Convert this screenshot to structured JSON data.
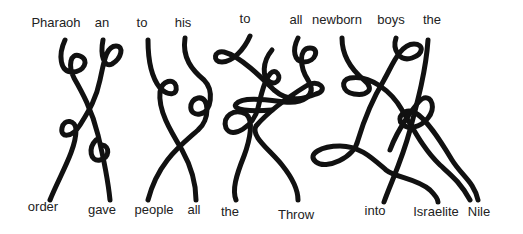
{
  "diagram": {
    "type": "tangled-lines-word-puzzle",
    "top_words": [
      {
        "label": "Pharaoh",
        "x": 56,
        "y": 16
      },
      {
        "label": "an",
        "x": 102,
        "y": 16
      },
      {
        "label": "to",
        "x": 142,
        "y": 16
      },
      {
        "label": "his",
        "x": 183,
        "y": 16
      },
      {
        "label": "to",
        "x": 245,
        "y": 12
      },
      {
        "label": "all",
        "x": 296,
        "y": 13
      },
      {
        "label": "newborn",
        "x": 337,
        "y": 13
      },
      {
        "label": "boys",
        "x": 391,
        "y": 13
      },
      {
        "label": "the",
        "x": 432,
        "y": 13
      }
    ],
    "bottom_words": [
      {
        "label": "order",
        "x": 43,
        "y": 200
      },
      {
        "label": "gave",
        "x": 102,
        "y": 203
      },
      {
        "label": "people",
        "x": 154,
        "y": 203
      },
      {
        "label": "all",
        "x": 194,
        "y": 203
      },
      {
        "label": "the",
        "x": 230,
        "y": 205
      },
      {
        "label": "Throw",
        "x": 296,
        "y": 208
      },
      {
        "label": "into",
        "x": 375,
        "y": 204
      },
      {
        "label": "Israelite",
        "x": 436,
        "y": 205
      },
      {
        "label": "Nile",
        "x": 479,
        "y": 205
      }
    ],
    "line_color": "#111111",
    "text_color": "#222222"
  }
}
